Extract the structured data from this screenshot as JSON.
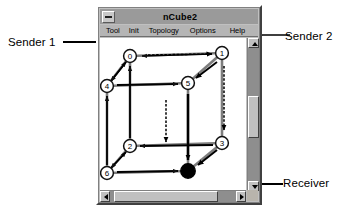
{
  "window": {
    "title": "nCube2",
    "sysmenu_icon": "system-menu-icon",
    "menu": [
      {
        "id": "tool",
        "label": "Tool"
      },
      {
        "id": "init",
        "label": "Init"
      },
      {
        "id": "topology",
        "label": "Topology"
      },
      {
        "id": "options",
        "label": "Options"
      },
      {
        "id": "help",
        "label": "Help"
      }
    ]
  },
  "annotations": [
    {
      "id": "sender1",
      "label": "Sender 1",
      "target": "node-0"
    },
    {
      "id": "sender2",
      "label": "Sender 2",
      "target": "node-1"
    },
    {
      "id": "receiver",
      "label": "Receiver",
      "target": "node-7"
    }
  ],
  "diagram": {
    "type": "hypercube-topology",
    "node_count": 8,
    "nodes": [
      {
        "id": "node-0",
        "label": "0",
        "x": 30,
        "y": 18,
        "state": "open",
        "role": "sender"
      },
      {
        "id": "node-1",
        "label": "1",
        "x": 122,
        "y": 15,
        "state": "open",
        "role": "sender"
      },
      {
        "id": "node-2",
        "label": "2",
        "x": 30,
        "y": 108,
        "state": "open",
        "role": "relay"
      },
      {
        "id": "node-3",
        "label": "3",
        "x": 122,
        "y": 105,
        "state": "open",
        "role": "relay"
      },
      {
        "id": "node-4",
        "label": "4",
        "x": 7,
        "y": 48,
        "state": "open",
        "role": "relay"
      },
      {
        "id": "node-5",
        "label": "5",
        "x": 88,
        "y": 45,
        "state": "open",
        "role": "relay"
      },
      {
        "id": "node-6",
        "label": "6",
        "x": 7,
        "y": 135,
        "state": "open",
        "role": "relay"
      },
      {
        "id": "node-7",
        "label": "",
        "x": 88,
        "y": 133,
        "state": "filled",
        "role": "receiver"
      }
    ],
    "edges": [
      {
        "from": "node-0",
        "to": "node-1"
      },
      {
        "from": "node-0",
        "to": "node-2"
      },
      {
        "from": "node-0",
        "to": "node-4"
      },
      {
        "from": "node-1",
        "to": "node-3"
      },
      {
        "from": "node-1",
        "to": "node-5"
      },
      {
        "from": "node-2",
        "to": "node-3"
      },
      {
        "from": "node-2",
        "to": "node-6"
      },
      {
        "from": "node-3",
        "to": "node-7"
      },
      {
        "from": "node-4",
        "to": "node-5"
      },
      {
        "from": "node-4",
        "to": "node-6"
      },
      {
        "from": "node-5",
        "to": "node-7"
      },
      {
        "from": "node-6",
        "to": "node-7"
      }
    ],
    "routes": [
      {
        "id": "route-sender1",
        "from": "node-0",
        "to": "node-7",
        "hops": [
          "node-0",
          "node-1",
          "node-3",
          "node-7"
        ]
      },
      {
        "id": "route-sender2",
        "from": "node-1",
        "to": "node-7",
        "hops": [
          "node-1",
          "node-5",
          "node-7"
        ]
      }
    ]
  },
  "scrollbars": {
    "vertical": {
      "up_icon": "arrow-up-icon",
      "down_icon": "arrow-down-icon"
    },
    "horizontal": {
      "left_icon": "arrow-left-icon",
      "right_icon": "arrow-right-icon"
    }
  },
  "colors": {
    "window_face": "#c0c0c0",
    "title_bar": "#9a9a9a",
    "canvas": "#ffffff",
    "edge": "#808080",
    "arrow": "#000000",
    "node_fill": "#ffffff",
    "receiver_fill": "#000000"
  }
}
